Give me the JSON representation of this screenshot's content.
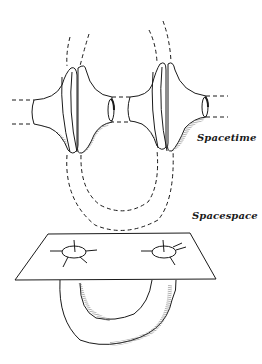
{
  "diagram": {
    "labels": {
      "spacetime": "Spacetime",
      "spacespace": "Spacespace"
    },
    "colors": {
      "line": "#1a1a1a",
      "background": "#ffffff",
      "shading": "#555555"
    },
    "panels": [
      {
        "name": "spacetime",
        "description": "two flared wormhole mouths connected by dashed curved tubes"
      },
      {
        "name": "spacespace",
        "description": "flat sheet with two holes connected by U-shaped tube beneath"
      }
    ]
  }
}
